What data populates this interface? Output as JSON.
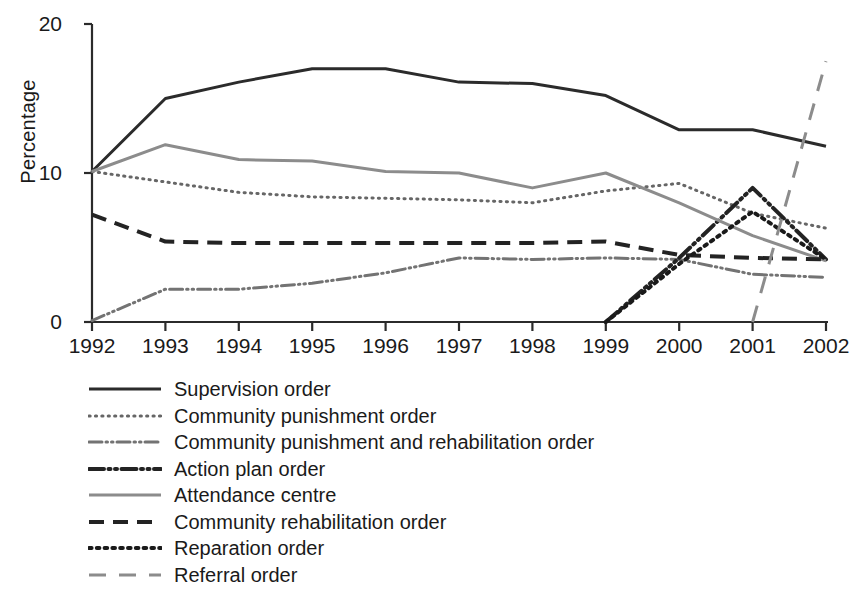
{
  "chart_data": {
    "type": "line",
    "title": "",
    "xlabel": "",
    "ylabel": "Percentage",
    "x": [
      1992,
      1993,
      1994,
      1995,
      1996,
      1997,
      1998,
      1999,
      2000,
      2001,
      2002
    ],
    "xtick_labels": [
      "1992",
      "1993",
      "1994",
      "1995",
      "1996",
      "1997",
      "1998",
      "1999",
      "2000",
      "2001",
      "2002"
    ],
    "ytick_labels": [
      "0",
      "10",
      "20"
    ],
    "ytick_values": [
      0,
      10,
      20
    ],
    "ylim": [
      0,
      20
    ],
    "xlim": [
      1992,
      2002
    ],
    "grid": false,
    "legend_position": "below-left",
    "series": [
      {
        "name": "Supervision order",
        "style": "solid",
        "color": "#2b2b2b",
        "width": 3,
        "x": [
          1992,
          1993,
          1994,
          1995,
          1996,
          1997,
          1998,
          1999,
          2000,
          2001,
          2002
        ],
        "values": [
          10.1,
          15.0,
          16.1,
          17.0,
          17.0,
          16.1,
          16.0,
          15.2,
          12.9,
          12.9,
          11.8
        ]
      },
      {
        "name": "Community punishment order",
        "style": "dotted",
        "color": "#666666",
        "width": 3,
        "x": [
          1992,
          1993,
          1994,
          1995,
          1996,
          1997,
          1998,
          1999,
          2000,
          2001,
          2002
        ],
        "values": [
          10.1,
          9.4,
          8.7,
          8.4,
          8.3,
          8.2,
          8.0,
          8.8,
          9.3,
          7.3,
          6.3
        ]
      },
      {
        "name": "Community punishment and rehabilitation order",
        "style": "dash-dot-dot",
        "color": "#737373",
        "width": 3,
        "x": [
          1992,
          1993,
          1994,
          1995,
          1996,
          1997,
          1998,
          1999,
          2000,
          2001,
          2002
        ],
        "values": [
          0.1,
          2.2,
          2.2,
          2.6,
          3.3,
          4.3,
          4.2,
          4.3,
          4.2,
          3.2,
          3.0
        ]
      },
      {
        "name": "Action plan order",
        "style": "dash-dot-dot-dark",
        "color": "#232323",
        "width": 4,
        "x": [
          1999,
          2000,
          2001,
          2002
        ],
        "values": [
          0.0,
          4.3,
          9.0,
          4.2
        ]
      },
      {
        "name": "Attendance centre",
        "style": "solid-grey",
        "color": "#8c8c8c",
        "width": 3,
        "x": [
          1992,
          1993,
          1994,
          1995,
          1996,
          1997,
          1998,
          1999,
          2000,
          2001,
          2002
        ],
        "values": [
          10.1,
          11.9,
          10.9,
          10.8,
          10.1,
          10.0,
          9.0,
          10.0,
          8.0,
          5.8,
          4.1
        ]
      },
      {
        "name": "Community rehabilitation order",
        "style": "dashed",
        "color": "#232323",
        "width": 4,
        "x": [
          1992,
          1993,
          1994,
          1995,
          1996,
          1997,
          1998,
          1999,
          2000,
          2001,
          2002
        ],
        "values": [
          7.2,
          5.4,
          5.3,
          5.3,
          5.3,
          5.3,
          5.3,
          5.4,
          4.5,
          4.3,
          4.2
        ]
      },
      {
        "name": "Reparation order",
        "style": "dotted-heavy",
        "color": "#1a1a1a",
        "width": 4,
        "x": [
          1999,
          2000,
          2001,
          2002
        ],
        "values": [
          0.0,
          3.9,
          7.4,
          4.2
        ]
      },
      {
        "name": "Referral order",
        "style": "long-dash",
        "color": "#8c8c8c",
        "width": 3,
        "x": [
          2001,
          2002
        ],
        "values": [
          0.0,
          17.5
        ]
      }
    ]
  },
  "legend": {
    "items": [
      {
        "label": "Supervision order"
      },
      {
        "label": "Community punishment order"
      },
      {
        "label": "Community punishment and rehabilitation order"
      },
      {
        "label": "Action plan order"
      },
      {
        "label": "Attendance centre"
      },
      {
        "label": "Community rehabilitation order"
      },
      {
        "label": "Reparation order"
      },
      {
        "label": "Referral order"
      }
    ]
  },
  "axes": {
    "y_title": "Percentage"
  }
}
